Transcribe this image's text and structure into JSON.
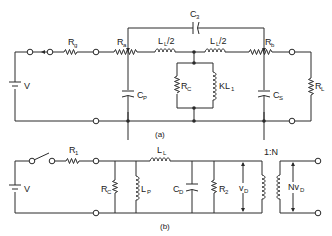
{
  "figure": {
    "type": "circuit-schematic",
    "colors": {
      "ink": "#2a2a2a",
      "background": "#ffffff"
    }
  },
  "circuit_a": {
    "caption": "(a)",
    "components": {
      "source": {
        "symbol": "battery",
        "label": "V"
      },
      "source_resistor": {
        "symbol": "resistor",
        "label": "R",
        "subscript": "g"
      },
      "tapped_resistor_a": {
        "symbol": "tapped-resistor",
        "label": "R",
        "subscript": "a"
      },
      "capacitor_p": {
        "symbol": "capacitor",
        "label": "C",
        "subscript": "P"
      },
      "inductor_left": {
        "symbol": "inductor",
        "label": "L",
        "subscript": "L",
        "suffix": "/2"
      },
      "inductor_right": {
        "symbol": "inductor",
        "label": "L",
        "subscript": "L",
        "suffix": "/2"
      },
      "capacitor_3": {
        "symbol": "capacitor",
        "label": "C",
        "subscript": "3"
      },
      "shunt_resistor": {
        "symbol": "resistor",
        "label": "R",
        "subscript": "C"
      },
      "shunt_inductor": {
        "symbol": "inductor",
        "label": "KL",
        "subscript": "1"
      },
      "tapped_resistor_b": {
        "symbol": "tapped-resistor",
        "label": "R",
        "subscript": "b"
      },
      "capacitor_s": {
        "symbol": "capacitor",
        "label": "C",
        "subscript": "S"
      },
      "load_resistor": {
        "symbol": "resistor",
        "label": "R",
        "subscript": "L"
      }
    }
  },
  "circuit_b": {
    "caption": "(b)",
    "components": {
      "source": {
        "symbol": "battery",
        "label": "V"
      },
      "switch": {
        "symbol": "switch",
        "label": ""
      },
      "series_resistor": {
        "symbol": "resistor",
        "label": "R",
        "subscript": "1"
      },
      "shunt_resistor": {
        "symbol": "resistor",
        "label": "R",
        "subscript": "C"
      },
      "shunt_inductor": {
        "symbol": "inductor",
        "label": "L",
        "subscript": "P"
      },
      "series_inductor": {
        "symbol": "inductor",
        "label": "L",
        "subscript": "L"
      },
      "capacitor_d": {
        "symbol": "capacitor",
        "label": "C",
        "subscript": "D"
      },
      "load_resistor": {
        "symbol": "resistor",
        "label": "R",
        "subscript": "2"
      },
      "primary_voltage": {
        "symbol": "voltage-arrow",
        "label": "v",
        "subscript": "D"
      },
      "transformer": {
        "symbol": "transformer",
        "label": "1:N"
      },
      "secondary_voltage": {
        "symbol": "voltage-arrow",
        "label": "Nv",
        "subscript": "D"
      }
    }
  }
}
